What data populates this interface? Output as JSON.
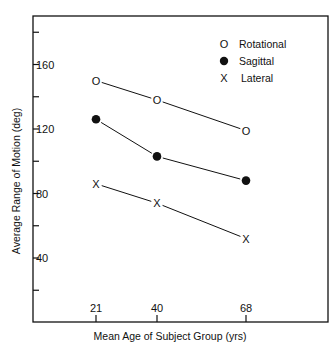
{
  "chart_data": {
    "type": "line",
    "title": "",
    "xlabel": "Mean  Age of  Subject  Group (yrs)",
    "ylabel": "Average  Range of  Motion (deg)",
    "x": [
      21,
      40,
      68
    ],
    "x_tick_labels": [
      "21",
      "40",
      "68"
    ],
    "y_tick_labels": [
      "40",
      "80",
      "120",
      "160"
    ],
    "y_major_ticks": [
      40,
      80,
      120,
      160
    ],
    "y_minor_ticks": [
      20,
      60,
      100,
      140,
      180
    ],
    "ylim": [
      0,
      190
    ],
    "grid": false,
    "legend_position": "upper right",
    "series": [
      {
        "name": "Rotational",
        "marker": "O",
        "values": [
          150,
          138,
          119
        ]
      },
      {
        "name": "Sagittal",
        "marker": "filled-circle",
        "values": [
          126,
          103,
          88
        ]
      },
      {
        "name": "Lateral",
        "marker": "X",
        "values": [
          86,
          74,
          52
        ]
      }
    ]
  },
  "legend": {
    "items": [
      {
        "symbol": "O",
        "label": "Rotational"
      },
      {
        "symbol": "●",
        "label": "Sagittal"
      },
      {
        "symbol": "X",
        "label": "Lateral"
      }
    ]
  },
  "colors": {
    "ink": "#111111",
    "background": "#ffffff"
  }
}
